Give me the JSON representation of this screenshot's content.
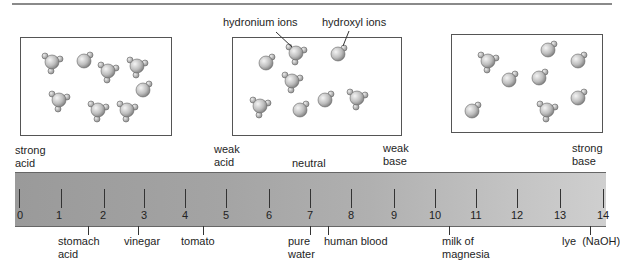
{
  "diagram": {
    "ion_labels": {
      "hydronium": "hydronium ions",
      "hydroxyl": "hydroxyl ions"
    },
    "boxes": [
      {
        "name": "acidic-solution",
        "hydronium_count": 6,
        "hydroxyl_count": 2
      },
      {
        "name": "neutral-solution",
        "hydronium_count": 5,
        "hydroxyl_count": 4
      },
      {
        "name": "basic-solution",
        "hydronium_count": 2,
        "hydroxyl_count": 6
      }
    ],
    "region_labels": {
      "strong_acid": [
        "strong",
        "acid"
      ],
      "weak_acid": [
        "weak",
        "acid"
      ],
      "neutral": "neutral",
      "weak_base": [
        "weak",
        "base"
      ],
      "strong_base": [
        "strong",
        "base"
      ]
    },
    "scale": {
      "ticks": [
        "0",
        "1",
        "2",
        "3",
        "4",
        "5",
        "6",
        "7",
        "8",
        "9",
        "10",
        "11",
        "12",
        "13",
        "14"
      ]
    },
    "examples": [
      {
        "label": [
          "stomach",
          "acid"
        ],
        "ph": 1.5
      },
      {
        "label": [
          "vinegar"
        ],
        "ph": 3.0
      },
      {
        "label": [
          "tomato"
        ],
        "ph": 4.2
      },
      {
        "label": [
          "pure",
          "water"
        ],
        "ph": 7.0
      },
      {
        "label": [
          "human blood"
        ],
        "ph": 7.4
      },
      {
        "label": [
          "milk of",
          "magnesia"
        ],
        "ph": 10.4
      },
      {
        "label": [
          "lye  (NaOH)"
        ],
        "ph": 13.8
      }
    ]
  }
}
